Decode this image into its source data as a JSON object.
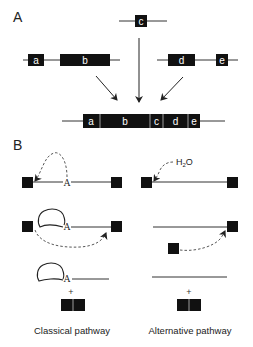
{
  "panel_a": {
    "label": "A",
    "top_exon": "c",
    "left_exons": [
      "a",
      "b"
    ],
    "right_exons": [
      "d",
      "e"
    ],
    "merged_exons": [
      "a",
      "b",
      "c",
      "d",
      "e"
    ]
  },
  "panel_b": {
    "label": "B",
    "branch_point": "A",
    "water_label": "H",
    "water_sub": "2",
    "water_tail": "O",
    "plus": "+",
    "classical_label": "Classical pathway",
    "alternative_label": "Alternative pathway"
  },
  "colors": {
    "ink": "#111111",
    "line": "#333333",
    "dashed": "#444444",
    "exon_text": "#ffffff"
  }
}
